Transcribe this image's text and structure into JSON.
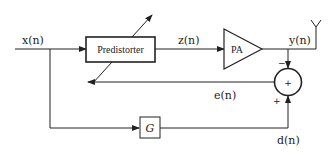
{
  "diagram": {
    "type": "block-diagram",
    "blocks": {
      "predistorter": {
        "label": "Predistorter"
      },
      "pa": {
        "label": "PA"
      },
      "gain": {
        "label": "G"
      },
      "summer": {
        "label": "+"
      }
    },
    "signals": {
      "input": "x(n)",
      "predistorted": "z(n)",
      "output": "y(n)",
      "error": "e(n)",
      "desired": "d(n)"
    },
    "summer_signs": {
      "top": "−",
      "bottom": "+"
    },
    "colors": {
      "stroke": "#222222",
      "background": "#ffffff"
    }
  }
}
